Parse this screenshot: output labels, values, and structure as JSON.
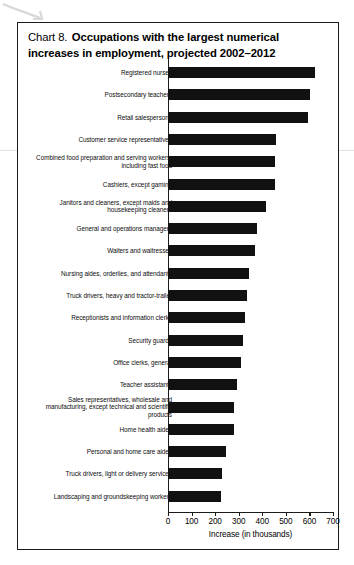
{
  "chart_data": {
    "type": "bar",
    "orientation": "horizontal",
    "title_prefix": "Chart 8.",
    "title": "Occupations with the largest numerical increases in employment, projected 2002–2012",
    "xlabel": "Increase (in thousands)",
    "ylabel": "",
    "xlim": [
      0,
      700
    ],
    "xticks": [
      0,
      100,
      200,
      300,
      400,
      500,
      600,
      700
    ],
    "grid": false,
    "legend": null,
    "bar_color": "#111111",
    "categories": [
      "Registered nurses",
      "Postsecondary teachers",
      "Retail salespersons",
      "Customer service representatives",
      "Combined food preparation and serving workers, including fast food",
      "Cashiers, except gaming",
      "Janitors and cleaners, except maids and housekeeping cleaners",
      "General and operations managers",
      "Waiters and waitresses",
      "Nursing aides, orderlies, and attendants",
      "Truck drivers, heavy and tractor-trailer",
      "Receptionists and information clerks",
      "Security guards",
      "Office clerks, general",
      "Teacher assistants",
      "Sales representatives, wholesale and manufacturing, except technical and scientific products",
      "Home health aides",
      "Personal and home care aides",
      "Truck drivers, light or delivery services",
      "Landscaping and groundskeeping workers"
    ],
    "values": [
      623,
      603,
      596,
      460,
      454,
      454,
      414,
      376,
      367,
      343,
      337,
      325,
      317,
      310,
      294,
      279,
      279,
      246,
      230,
      226
    ]
  }
}
